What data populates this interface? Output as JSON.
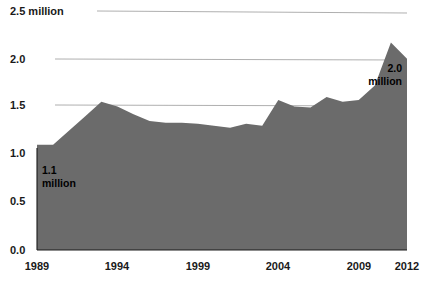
{
  "chart_data": {
    "type": "area",
    "title": "",
    "subtitle": "",
    "xlabel": "",
    "ylabel": "",
    "unit_label": "million",
    "xlim": [
      1989,
      2012
    ],
    "ylim": [
      0.0,
      2.5
    ],
    "grid": true,
    "gridlines_at": [
      1.5,
      2.0,
      2.5
    ],
    "legend": "none",
    "fill_color": "#6b6b6b",
    "axis_color": "#1a1a1a",
    "grid_color": "#9a9a9a",
    "background_color": "#ffffff",
    "y_ticks": [
      {
        "value": 2.5,
        "label": "2.5 million"
      },
      {
        "value": 2.0,
        "label": "2.0"
      },
      {
        "value": 1.5,
        "label": "1.5"
      },
      {
        "value": 1.0,
        "label": "1.0"
      },
      {
        "value": 0.5,
        "label": "0.5"
      },
      {
        "value": 0.0,
        "label": "0.0"
      }
    ],
    "x_ticks": [
      {
        "value": 1989,
        "label": "1989"
      },
      {
        "value": 1994,
        "label": "1994"
      },
      {
        "value": 1999,
        "label": "1999"
      },
      {
        "value": 2004,
        "label": "2004"
      },
      {
        "value": 2009,
        "label": "2009"
      },
      {
        "value": 2012,
        "label": "2012"
      }
    ],
    "x": [
      1989,
      1990,
      1991,
      1992,
      1993,
      1994,
      1995,
      1996,
      1997,
      1998,
      1999,
      2000,
      2001,
      2002,
      2003,
      2004,
      2005,
      2006,
      2007,
      2008,
      2009,
      2010,
      2011,
      2012
    ],
    "values": [
      1.1,
      1.1,
      1.25,
      1.4,
      1.55,
      1.5,
      1.42,
      1.35,
      1.33,
      1.33,
      1.32,
      1.3,
      1.28,
      1.32,
      1.3,
      1.57,
      1.5,
      1.49,
      1.6,
      1.55,
      1.57,
      1.72,
      2.17,
      2.0
    ],
    "annotations": [
      {
        "name": "start-value",
        "text_line1": "1.1",
        "text_line2": "million",
        "x": 1989,
        "y": 1.1
      },
      {
        "name": "end-value",
        "text_line1": "2.0",
        "text_line2": "million",
        "x": 2012,
        "y": 2.0
      }
    ]
  }
}
